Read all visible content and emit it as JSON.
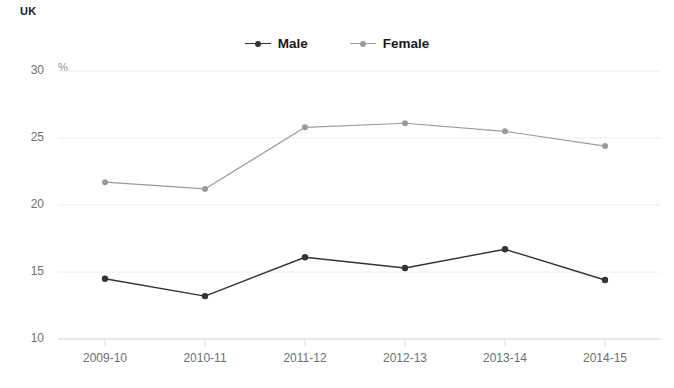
{
  "region": {
    "label": "UK"
  },
  "axis": {
    "unit": "%",
    "y_ticks": [
      "30",
      "25",
      "20",
      "15",
      "10"
    ],
    "x_ticks": [
      "2009-10",
      "2010-11",
      "2011-12",
      "2012-13",
      "2013-14",
      "2014-15"
    ]
  },
  "legend": {
    "items": [
      {
        "label": "Male",
        "color": "#333333",
        "marker": "line-dot-marker"
      },
      {
        "label": "Female",
        "color": "#9a9a9a",
        "marker": "line-dot-marker"
      }
    ]
  },
  "colors": {
    "male": "#333333",
    "female": "#9a9a9a",
    "grid": "#ececec",
    "axis_text": "#6e6e6e",
    "title_text": "#1a1a1a",
    "background": "#ffffff"
  },
  "chart_data": {
    "type": "line",
    "title": "UK",
    "subtitle": "",
    "xlabel": "",
    "ylabel": "%",
    "categories": [
      "2009-10",
      "2010-11",
      "2011-12",
      "2012-13",
      "2013-14",
      "2014-15"
    ],
    "series": [
      {
        "name": "Male",
        "color": "#333333",
        "values": [
          14.5,
          13.2,
          16.1,
          15.3,
          16.7,
          14.4
        ]
      },
      {
        "name": "Female",
        "color": "#9a9a9a",
        "values": [
          21.7,
          21.2,
          25.8,
          26.1,
          25.5,
          24.4
        ]
      }
    ],
    "ylim": [
      10,
      30
    ],
    "yticks": [
      10,
      15,
      20,
      25,
      30
    ],
    "grid": true,
    "legend_position": "top-center",
    "markers": true
  }
}
